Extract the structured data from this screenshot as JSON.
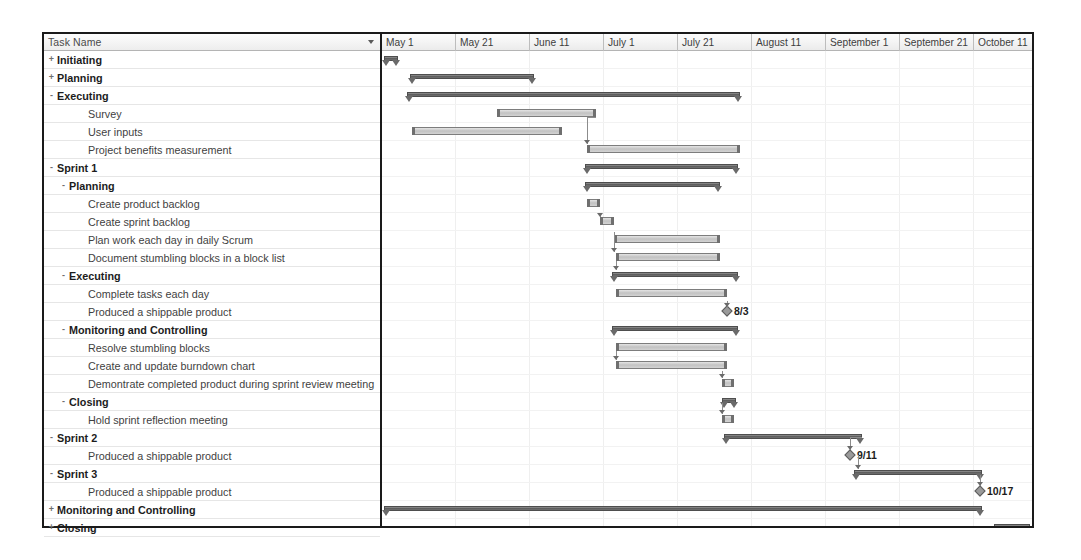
{
  "grid": {
    "header_label": "Task Name",
    "header_icon": "chevron-down-icon"
  },
  "timeline": {
    "columns": [
      {
        "label": "May 1",
        "x": 0,
        "w": 74
      },
      {
        "label": "May 21",
        "w": 74,
        "x": 74
      },
      {
        "label": "June 11",
        "w": 74,
        "x": 148
      },
      {
        "label": "July 1",
        "w": 74,
        "x": 222
      },
      {
        "label": "July 21",
        "w": 74,
        "x": 296
      },
      {
        "label": "August 11",
        "w": 74,
        "x": 370
      },
      {
        "label": "September 1",
        "w": 74,
        "x": 444
      },
      {
        "label": "September 21",
        "w": 74,
        "x": 518
      },
      {
        "label": "October 11",
        "w": 74,
        "x": 592
      },
      {
        "label": "N",
        "w": 74,
        "x": 666
      }
    ]
  },
  "tasks": [
    {
      "name": "Initiating",
      "level": 0,
      "twist": "+",
      "bar": "summary",
      "start": 2,
      "end": 16
    },
    {
      "name": "Planning",
      "level": 0,
      "twist": "+",
      "bar": "summary",
      "start": 28,
      "end": 152
    },
    {
      "name": "Executing",
      "level": 0,
      "twist": "-",
      "bar": "summary",
      "start": 25,
      "end": 358
    },
    {
      "name": "Survey",
      "level": 2,
      "twist": "",
      "bar": "task",
      "start": 115,
      "end": 214
    },
    {
      "name": "User inputs",
      "level": 2,
      "twist": "",
      "bar": "task",
      "start": 30,
      "end": 180
    },
    {
      "name": "Project benefits measurement",
      "level": 2,
      "twist": "",
      "bar": "task",
      "start": 205,
      "end": 358
    },
    {
      "name": "Sprint 1",
      "level": 0,
      "twist": "-",
      "bar": "summary",
      "start": 203,
      "end": 356
    },
    {
      "name": "Planning",
      "level": 1,
      "twist": "-",
      "bar": "summary",
      "start": 203,
      "end": 338
    },
    {
      "name": "Create product backlog",
      "level": 2,
      "twist": "",
      "bar": "task",
      "start": 205,
      "end": 218
    },
    {
      "name": "Create sprint backlog",
      "level": 2,
      "twist": "",
      "bar": "task",
      "start": 218,
      "end": 232
    },
    {
      "name": "Plan work each day in daily Scrum",
      "level": 2,
      "twist": "",
      "bar": "task",
      "start": 232,
      "end": 338
    },
    {
      "name": "Document stumbling blocks in a block list",
      "level": 2,
      "twist": "",
      "bar": "task",
      "start": 234,
      "end": 338
    },
    {
      "name": "Executing",
      "level": 1,
      "twist": "-",
      "bar": "summary",
      "start": 230,
      "end": 356
    },
    {
      "name": "Complete tasks each day",
      "level": 2,
      "twist": "",
      "bar": "task",
      "start": 234,
      "end": 345
    },
    {
      "name": "Produced a shippable product",
      "level": 2,
      "twist": "",
      "bar": "milestone",
      "start": 345,
      "end": 345,
      "label": "8/3"
    },
    {
      "name": "Monitoring and Controlling",
      "level": 1,
      "twist": "-",
      "bar": "summary",
      "start": 230,
      "end": 356
    },
    {
      "name": "Resolve stumbling blocks",
      "level": 2,
      "twist": "",
      "bar": "task",
      "start": 234,
      "end": 345
    },
    {
      "name": "Create and update burndown chart",
      "level": 2,
      "twist": "",
      "bar": "task",
      "start": 234,
      "end": 345
    },
    {
      "name": "Demontrate completed product during sprint review meeting",
      "level": 2,
      "twist": "",
      "bar": "task",
      "start": 340,
      "end": 352
    },
    {
      "name": "Closing",
      "level": 1,
      "twist": "-",
      "bar": "summary",
      "start": 340,
      "end": 354
    },
    {
      "name": "Hold sprint reflection meeting",
      "level": 2,
      "twist": "",
      "bar": "task",
      "start": 340,
      "end": 352
    },
    {
      "name": "Sprint 2",
      "level": 0,
      "twist": "-",
      "bar": "summary",
      "start": 342,
      "end": 480
    },
    {
      "name": "Produced a shippable product",
      "level": 2,
      "twist": "",
      "bar": "milestone",
      "start": 468,
      "end": 468,
      "label": "9/11"
    },
    {
      "name": "Sprint 3",
      "level": 0,
      "twist": "-",
      "bar": "summary",
      "start": 472,
      "end": 600
    },
    {
      "name": "Produced a shippable product",
      "level": 2,
      "twist": "",
      "bar": "milestone",
      "start": 598,
      "end": 598,
      "label": "10/17"
    },
    {
      "name": "Monitoring and Controlling",
      "level": 0,
      "twist": "+",
      "bar": "summary",
      "start": 2,
      "end": 600
    },
    {
      "name": "Closing",
      "level": 0,
      "twist": "+",
      "bar": "summary",
      "start": 612,
      "end": 648
    }
  ],
  "chart_data": {
    "type": "bar",
    "xlabel": "Timeline",
    "ylabel": "Task Name",
    "axis_tick_labels": [
      "May 1",
      "May 21",
      "June 11",
      "July 1",
      "July 21",
      "August 11",
      "September 1",
      "September 21",
      "October 11",
      "N"
    ],
    "milestones": [
      {
        "task": "Produced a shippable product",
        "sprint": "Sprint 1",
        "date": "8/3"
      },
      {
        "task": "Produced a shippable product",
        "sprint": "Sprint 2",
        "date": "9/11"
      },
      {
        "task": "Produced a shippable product",
        "sprint": "Sprint 3",
        "date": "10/17"
      }
    ],
    "grid": true,
    "legend": "none"
  }
}
